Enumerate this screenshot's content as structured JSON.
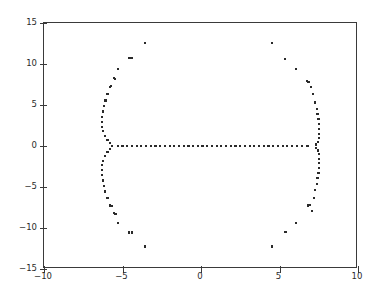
{
  "figure": {
    "type": "scatter-plot",
    "background": "#ffffff",
    "frame_color": "#3a3a3a",
    "marker_color": "#2a2a2a"
  },
  "axes": {
    "x_ticks": [
      "-10",
      "-5",
      "0",
      "5",
      "10"
    ],
    "x_tick_values": [
      -10,
      -5,
      0,
      5,
      10
    ],
    "y_ticks": [
      "15",
      "10",
      "5",
      "0",
      "-5",
      "-10",
      "-15"
    ],
    "y_tick_values": [
      15,
      10,
      5,
      0,
      -5,
      -10,
      -15
    ],
    "xlim": [
      -10,
      10
    ],
    "ylim": [
      -15,
      15
    ]
  },
  "chart_data": {
    "type": "scatter",
    "title": "",
    "xlabel": "",
    "ylabel": "",
    "xlim": [
      -10,
      10
    ],
    "ylim": [
      -15,
      15
    ],
    "grid": false,
    "legend": null,
    "marker": "square",
    "marker_color": "#2a2a2a",
    "series": [
      {
        "name": "eigenvalues",
        "points": [
          [
            -3.55,
            12.55
          ],
          [
            4.52,
            12.55
          ],
          [
            -3.55,
            -12.25
          ],
          [
            4.52,
            -12.25
          ],
          [
            -4.55,
            10.75
          ],
          [
            -4.4,
            10.75
          ],
          [
            -4.58,
            -10.55
          ],
          [
            -4.42,
            -10.55
          ],
          [
            5.35,
            10.65
          ],
          [
            5.38,
            -10.5
          ],
          [
            -5.28,
            9.35
          ],
          [
            6.05,
            9.35
          ],
          [
            -5.28,
            -9.35
          ],
          [
            6.05,
            -9.35
          ],
          [
            -5.55,
            8.25
          ],
          [
            -5.48,
            8.2
          ],
          [
            6.75,
            7.95
          ],
          [
            6.85,
            7.8
          ],
          [
            -5.52,
            -8.2
          ],
          [
            -5.45,
            -8.25
          ],
          [
            6.8,
            -7.25
          ],
          [
            6.92,
            -7.2
          ],
          [
            -5.72,
            7.35
          ],
          [
            -5.8,
            7.2
          ],
          [
            -5.7,
            -7.3
          ],
          [
            -5.78,
            -7.25
          ],
          [
            7.02,
            7.2
          ],
          [
            7.05,
            -7.9
          ],
          [
            -5.95,
            6.35
          ],
          [
            7.15,
            6.35
          ],
          [
            -5.95,
            -6.35
          ],
          [
            7.18,
            -6.3
          ],
          [
            -6.08,
            5.55
          ],
          [
            7.28,
            5.3
          ],
          [
            -6.1,
            -5.55
          ],
          [
            7.28,
            -5.35
          ],
          [
            -6.18,
            4.85
          ],
          [
            7.38,
            4.55
          ],
          [
            -6.18,
            -4.85
          ],
          [
            7.38,
            -4.6
          ],
          [
            -6.25,
            4.2
          ],
          [
            7.42,
            3.9
          ],
          [
            -6.25,
            -4.2
          ],
          [
            7.42,
            -3.95
          ],
          [
            -6.28,
            3.55
          ],
          [
            7.48,
            3.25
          ],
          [
            -6.28,
            -3.55
          ],
          [
            7.48,
            -3.3
          ],
          [
            -6.3,
            2.95
          ],
          [
            7.5,
            2.65
          ],
          [
            -6.3,
            -2.95
          ],
          [
            7.5,
            -2.7
          ],
          [
            -6.28,
            2.35
          ],
          [
            7.52,
            2.05
          ],
          [
            -6.28,
            -2.35
          ],
          [
            7.52,
            -2.1
          ],
          [
            -6.22,
            1.8
          ],
          [
            7.52,
            1.5
          ],
          [
            -6.22,
            -1.8
          ],
          [
            7.52,
            -1.55
          ],
          [
            -6.1,
            1.25
          ],
          [
            7.5,
            0.95
          ],
          [
            -6.1,
            -1.25
          ],
          [
            7.5,
            -1.0
          ],
          [
            -5.95,
            0.75
          ],
          [
            7.45,
            0.5
          ],
          [
            -5.95,
            -0.75
          ],
          [
            7.45,
            -0.55
          ],
          [
            -5.8,
            0.35
          ],
          [
            7.35,
            0.18
          ],
          [
            -5.8,
            -0.35
          ],
          [
            7.35,
            -0.2
          ],
          [
            -5.68,
            0.0
          ],
          [
            -5.3,
            0.0
          ],
          [
            -5.0,
            0.0
          ],
          [
            -4.7,
            0.0
          ],
          [
            -4.4,
            0.0
          ],
          [
            -4.1,
            0.0
          ],
          [
            -3.8,
            0.0
          ],
          [
            -3.5,
            0.0
          ],
          [
            -3.2,
            0.0
          ],
          [
            -2.9,
            0.0
          ],
          [
            -2.6,
            0.0
          ],
          [
            -2.3,
            0.0
          ],
          [
            -2.0,
            0.0
          ],
          [
            -1.7,
            0.0
          ],
          [
            -1.4,
            0.0
          ],
          [
            -1.1,
            0.0
          ],
          [
            -0.8,
            0.0
          ],
          [
            -0.5,
            0.0
          ],
          [
            -0.2,
            0.0
          ],
          [
            0.1,
            0.0
          ],
          [
            0.4,
            0.0
          ],
          [
            0.7,
            0.0
          ],
          [
            1.0,
            0.0
          ],
          [
            1.3,
            0.0
          ],
          [
            1.6,
            0.0
          ],
          [
            1.9,
            0.0
          ],
          [
            2.2,
            0.0
          ],
          [
            2.5,
            0.0
          ],
          [
            2.8,
            0.0
          ],
          [
            3.1,
            0.0
          ],
          [
            3.4,
            0.0
          ],
          [
            3.7,
            0.0
          ],
          [
            4.0,
            0.0
          ],
          [
            4.3,
            0.0
          ],
          [
            4.6,
            0.0
          ],
          [
            4.9,
            0.0
          ],
          [
            5.2,
            0.0
          ],
          [
            5.5,
            0.0
          ],
          [
            5.8,
            0.0
          ],
          [
            6.1,
            0.0
          ],
          [
            6.45,
            0.0
          ],
          [
            6.78,
            0.0
          ]
        ]
      }
    ]
  }
}
